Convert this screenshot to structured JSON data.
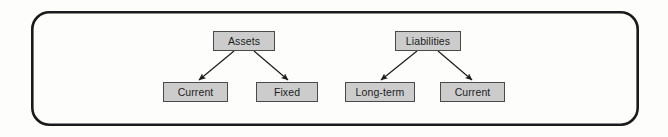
{
  "diagram": {
    "type": "hierarchy-tree",
    "frame": {
      "shape": "rounded-rectangle",
      "x": 31,
      "y": 11,
      "width": 608,
      "height": 115,
      "corner_radius": 17,
      "stroke_color": "#1a1a1a",
      "stroke_width": 2.6,
      "fill_color": "#fdfdfc"
    },
    "style": {
      "node_fill": "#cccccc",
      "node_border": "#4a4a4a",
      "node_text_color": "#1c1c1c",
      "connector_color": "#1c1c1c",
      "background": "#fdfdfc"
    },
    "trees": [
      {
        "name": "assets-tree",
        "root": {
          "id": "assets",
          "label": "Assets",
          "x": 213,
          "y": 31,
          "width": 62,
          "height": 20
        },
        "children": [
          {
            "id": "assets-current",
            "label": "Current",
            "x": 163,
            "y": 82,
            "width": 65,
            "height": 20
          },
          {
            "id": "assets-fixed",
            "label": "Fixed",
            "x": 256,
            "y": 82,
            "width": 62,
            "height": 20
          }
        ]
      },
      {
        "name": "liabilities-tree",
        "root": {
          "id": "liabilities",
          "label": "Liabilities",
          "x": 395,
          "y": 31,
          "width": 66,
          "height": 20
        },
        "children": [
          {
            "id": "liabilities-long-term",
            "label": "Long-term",
            "x": 345,
            "y": 82,
            "width": 70,
            "height": 20
          },
          {
            "id": "liabilities-current",
            "label": "Current",
            "x": 440,
            "y": 82,
            "width": 65,
            "height": 20
          }
        ]
      }
    ],
    "connectors": [
      {
        "id": "assets-to-current",
        "from": "assets",
        "to": "assets-current",
        "x1": 234,
        "y1": 51,
        "x2": 199,
        "y2": 80,
        "arrow": "end"
      },
      {
        "id": "assets-to-fixed",
        "from": "assets",
        "to": "assets-fixed",
        "x1": 254,
        "y1": 51,
        "x2": 288,
        "y2": 80,
        "arrow": "end"
      },
      {
        "id": "liabilities-to-long-term",
        "from": "liabilities",
        "to": "liabilities-long-term",
        "x1": 417,
        "y1": 51,
        "x2": 381,
        "y2": 80,
        "arrow": "end"
      },
      {
        "id": "liabilities-to-current",
        "from": "liabilities",
        "to": "liabilities-current",
        "x1": 438,
        "y1": 51,
        "x2": 472,
        "y2": 80,
        "arrow": "end"
      }
    ]
  }
}
